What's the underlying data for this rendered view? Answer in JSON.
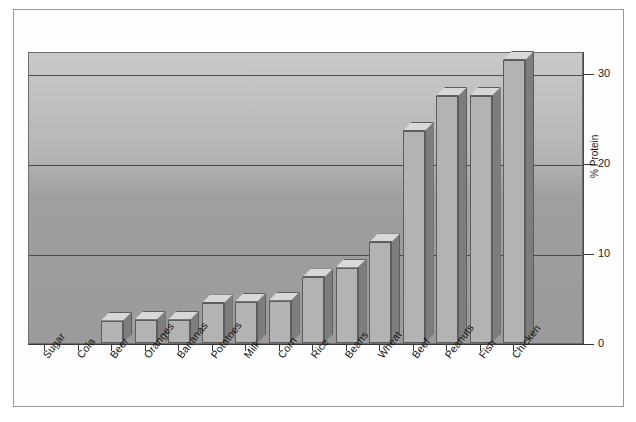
{
  "chart_data": {
    "type": "bar",
    "title": "",
    "subtitle": "",
    "xlabel": "",
    "ylabel": "% Protein",
    "ylim": [
      0,
      32.5
    ],
    "yticks": [
      0,
      10,
      20,
      30
    ],
    "ytick_labels": [
      "0",
      "10",
      "20",
      "30"
    ],
    "grid": true,
    "grid_axis": "y",
    "legend": false,
    "legend_position": "none",
    "style_3d": true,
    "categories": [
      "Sugar",
      "Cola",
      "Beer",
      "Oranges",
      "Bananas",
      "Potatoes",
      "Milk",
      "Corn",
      "Rice",
      "Beans",
      "Wheat",
      "Beef",
      "Peanuts",
      "Fish",
      "Chicken"
    ],
    "values": [
      0,
      0,
      2.5,
      2.6,
      2.6,
      4.4,
      4.6,
      4.7,
      7.3,
      8.4,
      11.2,
      23.6,
      27.5,
      27.5,
      31.5
    ],
    "colors": {
      "bar_front": "#b3b3b3",
      "bar_side": "#7d7d7d",
      "bar_top": "#d8d8d8",
      "bar_edge": "#5d5d5d",
      "plot_background_top": "#c9c9c9",
      "plot_background_bottom": "#9b9b9b",
      "gridline": "#4a4a4a",
      "axis": "#3a3a3a",
      "text": "#141414",
      "frame": "#9a9a9a",
      "page_background": "#ffffff"
    }
  },
  "axes": {
    "y_title": "% Protein"
  }
}
